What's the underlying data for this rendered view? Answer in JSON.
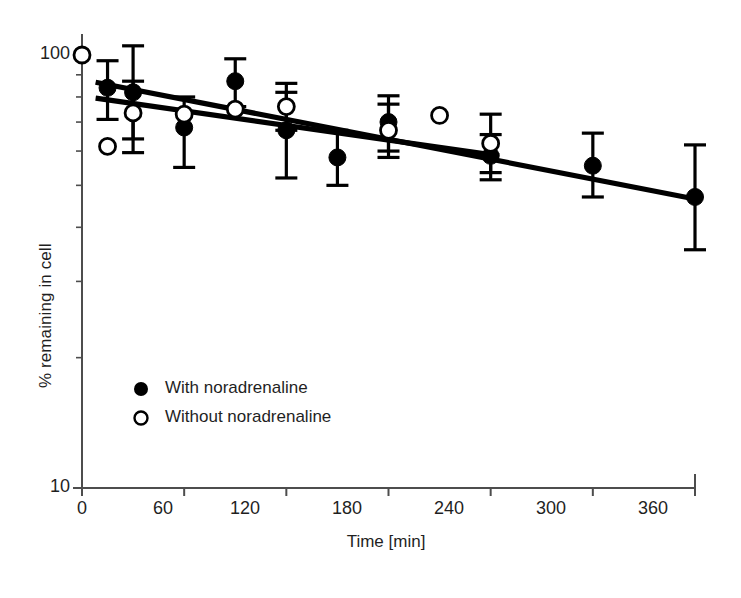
{
  "chart_data": {
    "type": "scatter",
    "title": "",
    "xlabel": "Time [min]",
    "ylabel": "% remaining in cell",
    "xlim": [
      0,
      360
    ],
    "ylim": [
      10,
      100
    ],
    "yscale": "log",
    "xscale": "linear",
    "grid": false,
    "legend_position": "inside-lower-left",
    "xticks": [
      0,
      60,
      120,
      180,
      240,
      300,
      360
    ],
    "xtick_labels": [
      "0",
      "60",
      "120",
      "180",
      "240",
      "300",
      "360"
    ],
    "yticks": [
      10,
      100
    ],
    "ytick_labels": [
      "10",
      "100"
    ],
    "yminor_ticks": [
      20,
      30,
      40,
      50,
      60,
      70,
      80,
      90
    ],
    "series": [
      {
        "name": "With noradrenaline",
        "marker": "filled-circle",
        "color": "#000000",
        "x": [
          15,
          30,
          60,
          90,
          120,
          150,
          180,
          240,
          300,
          360
        ],
        "y": [
          84.0,
          82.0,
          68.0,
          87.0,
          67.0,
          58.0,
          70.0,
          58.5,
          55.5,
          47.0
        ],
        "yerr_upper": [
          97.0,
          105.0,
          80.0,
          98.0,
          82.0,
          67.0,
          80.5,
          65.5,
          66.0,
          62.0
        ],
        "yerr_lower": [
          71.0,
          64.0,
          55.0,
          76.0,
          52.0,
          50.0,
          60.0,
          51.5,
          47.0,
          35.5
        ]
      },
      {
        "name": "Without noradrenaline",
        "marker": "open-circle",
        "color": "#000000",
        "x": [
          0,
          15,
          30,
          60,
          90,
          120,
          180,
          210,
          240
        ],
        "y": [
          100.0,
          61.5,
          73.5,
          73.0,
          75.0,
          76.0,
          67.0,
          72.5,
          62.5
        ],
        "yerr_upper": [
          null,
          null,
          87.0,
          null,
          null,
          86.0,
          77.0,
          null,
          73.0
        ],
        "yerr_lower": [
          null,
          null,
          59.5,
          null,
          null,
          67.0,
          58.0,
          null,
          53.5
        ]
      }
    ],
    "fit_lines": [
      {
        "name": "With noradrenaline fit",
        "for_series": "With noradrenaline",
        "x": [
          8,
          360
        ],
        "y": [
          86.5,
          46.5
        ]
      },
      {
        "name": "Without noradrenaline fit",
        "for_series": "Without noradrenaline",
        "x": [
          8,
          245
        ],
        "y": [
          79.5,
          58.5
        ]
      }
    ],
    "annotations": []
  },
  "legend": {
    "items": [
      {
        "marker": "filled-circle",
        "label": "With noradrenaline"
      },
      {
        "marker": "open-circle",
        "label": "Without noradrenaline"
      }
    ]
  },
  "axes": {
    "y_title": "% remaining in cell",
    "x_title": "Time [min]",
    "y_tick_top": "100",
    "y_tick_bottom": "10",
    "x_tick_0": "0",
    "x_tick_60": "60",
    "x_tick_120": "120",
    "x_tick_180": "180",
    "x_tick_240": "240",
    "x_tick_300": "300",
    "x_tick_360": "360"
  },
  "colors": {
    "ink": "#000000",
    "axis": "#4d4d4d",
    "background": "#ffffff"
  }
}
